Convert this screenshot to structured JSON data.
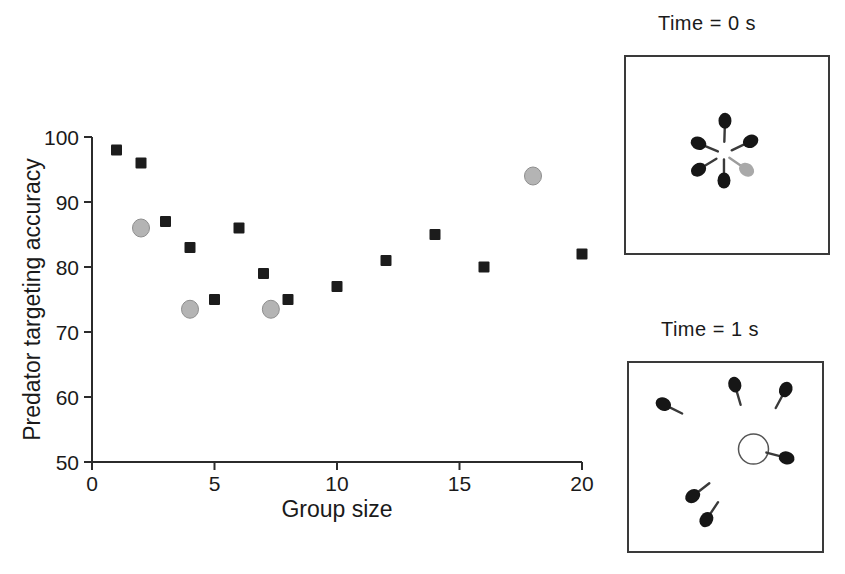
{
  "figure": {
    "background": "#ffffff"
  },
  "chart_data": {
    "type": "scatter",
    "title": "",
    "xlabel": "Group size",
    "ylabel": "Predator targeting accuracy",
    "xlim": [
      0,
      20
    ],
    "ylim": [
      50,
      100
    ],
    "x_ticks": [
      0,
      5,
      10,
      15,
      20
    ],
    "y_ticks": [
      50,
      60,
      70,
      80,
      90,
      100
    ],
    "grid": false,
    "legend": "none",
    "series": [
      {
        "name": "black-squares",
        "marker": "square",
        "color": "#1c1c1c",
        "points": [
          [
            1,
            98
          ],
          [
            2,
            96
          ],
          [
            3,
            87
          ],
          [
            4,
            83
          ],
          [
            5,
            75
          ],
          [
            6,
            86
          ],
          [
            7,
            79
          ],
          [
            8,
            75
          ],
          [
            10,
            77
          ],
          [
            12,
            81
          ],
          [
            14,
            85
          ],
          [
            16,
            80
          ],
          [
            20,
            82
          ]
        ]
      },
      {
        "name": "grey-circles",
        "marker": "circle",
        "color": "#b4b4b4",
        "edge": "#8e8e8e",
        "points": [
          [
            2,
            86
          ],
          [
            4,
            73.5
          ],
          [
            7.3,
            73.5
          ],
          [
            18,
            94
          ]
        ]
      }
    ]
  },
  "insets": [
    {
      "title": "Time = 0 s",
      "tail_target": {
        "x": 0.485,
        "y": 0.495
      },
      "open_circle": null,
      "prey": [
        {
          "x": 0.49,
          "y": 0.325,
          "color": "black"
        },
        {
          "x": 0.359,
          "y": 0.44,
          "color": "black"
        },
        {
          "x": 0.617,
          "y": 0.43,
          "color": "black"
        },
        {
          "x": 0.359,
          "y": 0.575,
          "color": "black"
        },
        {
          "x": 0.485,
          "y": 0.63,
          "color": "black"
        },
        {
          "x": 0.597,
          "y": 0.575,
          "color": "gray"
        }
      ]
    },
    {
      "title": "Time = 1 s",
      "tail_target": {
        "x": 0.645,
        "y": 0.458
      },
      "open_circle": {
        "x": 0.645,
        "y": 0.458,
        "r": 15
      },
      "prey": [
        {
          "x": 0.178,
          "y": 0.219,
          "color": "black"
        },
        {
          "x": 0.548,
          "y": 0.115,
          "color": "black"
        },
        {
          "x": 0.812,
          "y": 0.141,
          "color": "black"
        },
        {
          "x": 0.817,
          "y": 0.505,
          "color": "black"
        },
        {
          "x": 0.33,
          "y": 0.708,
          "color": "black"
        },
        {
          "x": 0.401,
          "y": 0.833,
          "color": "black"
        }
      ]
    }
  ],
  "colors": {
    "axis": "#2b2b2b",
    "text": "#1a1a1a",
    "prey_black": "#161616",
    "prey_black_tail": "#3a3a3a",
    "prey_gray": "#a9a9a9",
    "prey_gray_tail": "#9c9c9c",
    "inset_border": "#3a3a3a",
    "open_circle_stroke": "#555555"
  }
}
